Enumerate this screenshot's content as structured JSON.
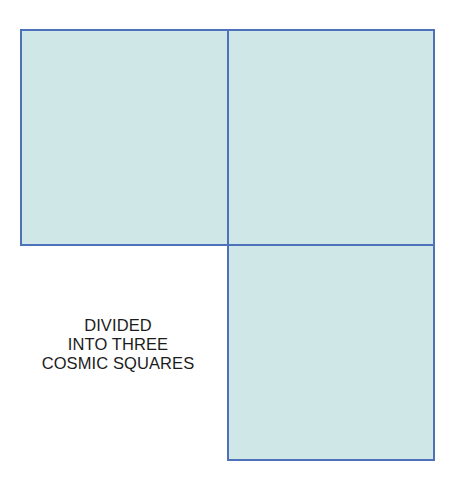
{
  "diagram": {
    "squares": [
      {
        "id": "top-left",
        "fill": "#cfe8e7",
        "border": "#4d72b9"
      },
      {
        "id": "top-right",
        "fill": "#cfe8e7",
        "border": "#4d72b9"
      },
      {
        "id": "bottom-right",
        "fill": "#cfe8e7",
        "border": "#4d72b9"
      }
    ],
    "caption": {
      "lines": [
        "DIVIDED",
        "INTO THREE",
        "COSMIC SQUARES"
      ]
    }
  }
}
